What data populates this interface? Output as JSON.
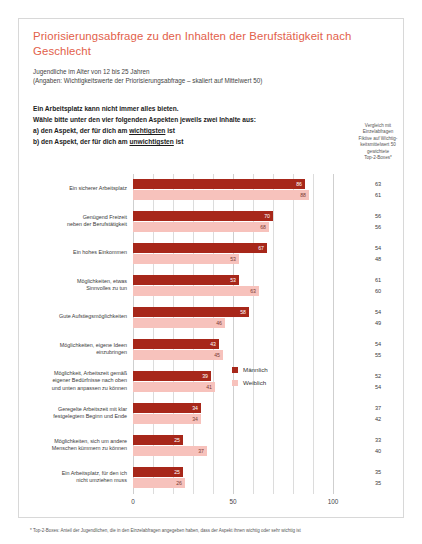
{
  "title": "Priorisierungsabfrage zu den Inhalten der Berufstätigkeit nach Geschlecht",
  "subtitle_1": "Jugendliche im Alter von 12 bis 25 Jahren",
  "subtitle_2": "(Angaben: Wichtigkeitswerte der Priorisierungsabfrage – skaliert auf Mittelwert 50)",
  "instructions": {
    "line_1": "Ein Arbeitsplatz kann nicht immer alles bieten.",
    "line_2": "Wähle bitte unter den vier folgenden Aspekten jeweils zwei Inhalte aus:",
    "line_3_pre": "a) den Aspekt, der für dich am ",
    "line_3_underline": "wichtigsten",
    "line_3_post": " ist",
    "line_4_pre": "b) den Aspekt, der für dich am ",
    "line_4_underline": "unwichtigsten",
    "line_4_post": " ist"
  },
  "comparison_column_header": {
    "line_1": "Vergleich mit",
    "line_2": "Einzelabfragen",
    "line_3": "Fiktive auf Wichtig-",
    "line_4": "keitsmittelwert 50",
    "line_5": "gewichtete",
    "line_6": "Top-2-Boxes*"
  },
  "footnote": "* Top-2-Boxes: Anteil der Jugendlichen, die in den Einzelabfragen angegeben haben, dass der Aspekt ihnen wichtig oder sehr wichtig ist",
  "colors": {
    "title": "#e2604a",
    "male": "#a7271a",
    "female": "#f7c2bc",
    "grid": "#dcdcdc"
  },
  "chart_data": {
    "type": "bar",
    "orientation": "horizontal",
    "title": "Priorisierungsabfrage zu den Inhalten der Berufstätigkeit nach Geschlecht",
    "xlabel": "",
    "ylabel": "",
    "xlim": [
      0,
      100
    ],
    "xticks": [
      "0",
      "50",
      "100"
    ],
    "grid": true,
    "legend_position": "middle-right",
    "categories": [
      "Ein sicherer Arbeitsplatz",
      "Genügend Freizeit neben der Berufstätigkeit",
      "Ein hohes Einkommen",
      "Möglichkeiten, etwas Sinnvolles zu tun",
      "Gute Aufstiegsmöglichkeiten",
      "Möglichkeiten, eigene Ideen einzubringen",
      "Möglichkeit, Arbeitszeit gemäß eigener Bedürfnisse nach oben und unten anpassen zu können",
      "Geregelte Arbeitszeit mit klar festgelegtem Beginn und Ende",
      "Möglichkeiten, sich um andere Menschen kümmern zu können",
      "Ein Arbeitsplatz, für den ich nicht umziehen muss"
    ],
    "category_lines": [
      [
        "Ein sicherer Arbeitsplatz"
      ],
      [
        "Genügend Freizeit",
        "neben der Berufstätigkeit"
      ],
      [
        "Ein hohes Einkommen"
      ],
      [
        "Möglichkeiten, etwas",
        "Sinnvolles zu tun"
      ],
      [
        "Gute Aufstiegsmöglichkeiten"
      ],
      [
        "Möglichkeiten, eigene Ideen",
        "einzubringen"
      ],
      [
        "Möglichkeit, Arbeitszeit gemäß",
        "eigener Bedürfnisse nach oben",
        "und unten anpassen zu können"
      ],
      [
        "Geregelte Arbeitszeit mit klar",
        "festgelegtem Beginn und Ende"
      ],
      [
        "Möglichkeiten, sich um andere",
        "Menschen kümmern zu können"
      ],
      [
        "Ein Arbeitsplatz, für den ich",
        "nicht umziehen muss"
      ]
    ],
    "series": [
      {
        "name": "Männlich",
        "color": "#a7271a",
        "values": [
          86,
          70,
          67,
          53,
          58,
          43,
          39,
          34,
          25,
          25
        ]
      },
      {
        "name": "Weiblich",
        "color": "#f7c2bc",
        "values": [
          88,
          68,
          53,
          63,
          46,
          45,
          41,
          34,
          37,
          26
        ]
      }
    ],
    "comparison_columns": [
      {
        "name": "Männlich",
        "values": [
          63,
          56,
          54,
          61,
          54,
          54,
          52,
          37,
          33,
          35
        ]
      },
      {
        "name": "Weiblich",
        "values": [
          61,
          56,
          48,
          60,
          49,
          55,
          54,
          42,
          40,
          35
        ]
      }
    ]
  }
}
